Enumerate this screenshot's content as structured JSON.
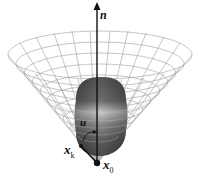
{
  "figure": {
    "type": "3D cone with inner blob (ellipsoidal region) and axis",
    "labels": {
      "axis": "n",
      "control": "u",
      "point_k": "x",
      "point_k_sub": "k",
      "origin": "x",
      "origin_sub": "0"
    },
    "colors": {
      "mesh": "#9a9a9a",
      "axis": "#111111",
      "blob_dark": "#5a5a5a",
      "blob_light": "#bdbdbd"
    }
  }
}
